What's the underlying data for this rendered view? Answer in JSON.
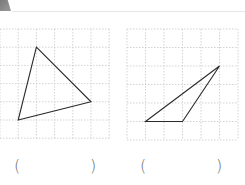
{
  "header": {
    "decoration": "section-tab"
  },
  "figures": [
    {
      "name": "figure-left",
      "grid": {
        "columns": 6,
        "rows": 6
      },
      "triangle": {
        "vertices_grid_units": [
          [
            2,
            1
          ],
          [
            5,
            4
          ],
          [
            1,
            5
          ]
        ]
      },
      "answer": {
        "open": "(",
        "close": ")",
        "value": ""
      }
    },
    {
      "name": "figure-right",
      "grid": {
        "columns": 6,
        "rows": 6
      },
      "triangle": {
        "vertices_grid_units": [
          [
            1,
            5
          ],
          [
            3,
            5
          ],
          [
            5,
            2
          ]
        ]
      },
      "answer": {
        "open": "(",
        "close": ")",
        "value": ""
      }
    }
  ],
  "colors": {
    "grid": "#c8c8c8",
    "triangle": "#2a2a2a",
    "paren": "#666666"
  }
}
